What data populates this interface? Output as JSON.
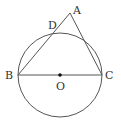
{
  "diagram": {
    "type": "geometry",
    "stroke_color": "#555555",
    "circle": {
      "center": "O",
      "cx": 60,
      "cy": 75,
      "r": 42
    },
    "points": {
      "A": {
        "label": "A",
        "x": 70,
        "y": 13
      },
      "B": {
        "label": "B",
        "x": 18,
        "y": 75
      },
      "C": {
        "label": "C",
        "x": 102,
        "y": 75
      },
      "D": {
        "label": "D",
        "x": 56,
        "y": 30
      },
      "O": {
        "label": "O",
        "x": 60,
        "y": 75
      }
    },
    "segments": [
      {
        "from": "B",
        "to": "C"
      },
      {
        "from": "B",
        "to": "A"
      },
      {
        "from": "A",
        "to": "C"
      }
    ]
  }
}
